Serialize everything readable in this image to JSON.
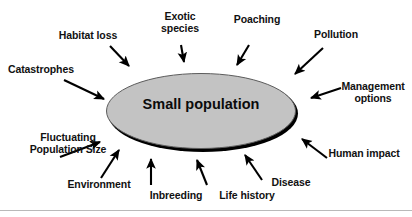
{
  "diagram": {
    "center": {
      "label": "Small population",
      "fill_color": "#c3c3c3",
      "edge_color": "#000000"
    },
    "colors": {
      "background": "#ffffff",
      "text": "#111111",
      "arrow": "#000000",
      "ellipse_fill": "#c3c3c3",
      "rule": "#b9b9b9"
    },
    "factors": [
      {
        "id": "habitat-loss",
        "label": "Habitat loss",
        "lines": [
          "Habitat loss"
        ]
      },
      {
        "id": "exotic-species",
        "label": "Exotic species",
        "lines": [
          "Exotic",
          "species"
        ]
      },
      {
        "id": "poaching",
        "label": "Poaching",
        "lines": [
          "Poaching"
        ]
      },
      {
        "id": "pollution",
        "label": "Pollution",
        "lines": [
          "Pollution"
        ]
      },
      {
        "id": "management-options",
        "label": "Management options",
        "lines": [
          "Management",
          "options"
        ]
      },
      {
        "id": "human-impact",
        "label": "Human impact",
        "lines": [
          "Human impact"
        ]
      },
      {
        "id": "disease",
        "label": "Disease",
        "lines": [
          "Disease"
        ]
      },
      {
        "id": "life-history",
        "label": "Life history",
        "lines": [
          "Life history"
        ]
      },
      {
        "id": "inbreeding",
        "label": "Inbreeding",
        "lines": [
          "Inbreeding"
        ]
      },
      {
        "id": "environment",
        "label": "Environment",
        "lines": [
          "Environment"
        ]
      },
      {
        "id": "fluctuating-population-size",
        "label": "Fluctuating Population Size",
        "lines": [
          "Fluctuating",
          "Population Size"
        ]
      },
      {
        "id": "catastrophes",
        "label": "Catastrophes",
        "lines": [
          "Catastrophes"
        ]
      }
    ],
    "labels": {
      "habitat_loss": "Habitat loss",
      "exotic_species_l1": "Exotic",
      "exotic_species_l2": "species",
      "poaching": "Poaching",
      "pollution": "Pollution",
      "management_l1": "Management",
      "management_l2": "options",
      "human_impact": "Human impact",
      "disease": "Disease",
      "life_history": "Life history",
      "inbreeding": "Inbreeding",
      "environment": "Environment",
      "fluctuating_l1": "Fluctuating",
      "fluctuating_l2": "Population Size",
      "catastrophes": "Catastrophes"
    }
  }
}
